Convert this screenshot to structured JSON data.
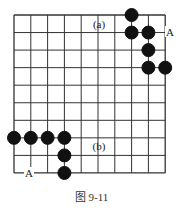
{
  "figure": {
    "caption": "图 9-11",
    "grid": {
      "cols": 10,
      "rows": 10,
      "x0": 14,
      "y0": 15,
      "dx": 16.8,
      "dy": 17.55,
      "line_color": "#333333"
    },
    "stones": [
      {
        "color": "black",
        "col": 7,
        "row": 0
      },
      {
        "color": "black",
        "col": 7,
        "row": 1
      },
      {
        "color": "black",
        "col": 8,
        "row": 1
      },
      {
        "color": "black",
        "col": 8,
        "row": 2
      },
      {
        "color": "black",
        "col": 8,
        "row": 3
      },
      {
        "color": "black",
        "col": 9,
        "row": 3
      },
      {
        "color": "black",
        "col": 0,
        "row": 7
      },
      {
        "color": "black",
        "col": 1,
        "row": 7
      },
      {
        "color": "black",
        "col": 2,
        "row": 7
      },
      {
        "color": "black",
        "col": 3,
        "row": 7
      },
      {
        "color": "black",
        "col": 3,
        "row": 8
      },
      {
        "color": "black",
        "col": 3,
        "row": 9
      }
    ],
    "labels": [
      {
        "text": "(a)",
        "x": 99,
        "y": 28
      },
      {
        "text": "A",
        "x": 170,
        "y": 36
      },
      {
        "text": "(b)",
        "x": 99,
        "y": 150
      },
      {
        "text": "A",
        "x": 29,
        "y": 177
      }
    ]
  }
}
